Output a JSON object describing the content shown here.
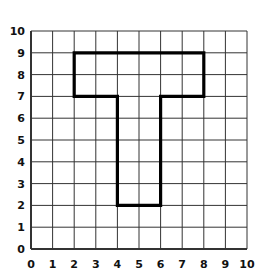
{
  "diagram": {
    "type": "grid-figure",
    "grid": {
      "x_min": 0,
      "x_max": 10,
      "y_min": 0,
      "y_max": 10,
      "step": 1
    },
    "x_tick_labels": [
      "0",
      "1",
      "2",
      "3",
      "4",
      "5",
      "6",
      "7",
      "8",
      "9",
      "10"
    ],
    "y_tick_labels": [
      "0",
      "1",
      "2",
      "3",
      "4",
      "5",
      "6",
      "7",
      "8",
      "9",
      "10"
    ],
    "shape": {
      "name": "T-shape",
      "vertices": [
        [
          2,
          9
        ],
        [
          8,
          9
        ],
        [
          8,
          7
        ],
        [
          6,
          7
        ],
        [
          6,
          2
        ],
        [
          4,
          2
        ],
        [
          4,
          7
        ],
        [
          2,
          7
        ]
      ],
      "stroke": "#000000"
    },
    "grid_color": "#333333"
  }
}
